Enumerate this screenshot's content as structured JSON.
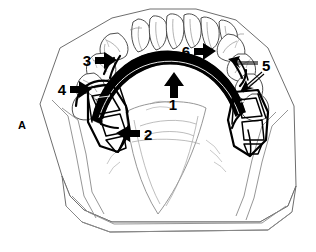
{
  "figure": {
    "panel_label": "A",
    "background_color": "#ffffff",
    "ink_color": "#000000",
    "cast_outline_color": "#6e6e6e",
    "width": 316,
    "height": 252
  },
  "callouts": [
    {
      "id": "callout-1",
      "label": "1",
      "arrow_direction": "up",
      "label_x": 173,
      "label_y": 103,
      "target": "anterior-palatal-strap-major-connector"
    },
    {
      "id": "callout-2",
      "label": "2",
      "arrow_direction": "left",
      "label_x": 144,
      "label_y": 139,
      "target": "left-lattice-retentive-framework"
    },
    {
      "id": "callout-3",
      "label": "3",
      "arrow_direction": "right",
      "label_x": 89,
      "label_y": 65,
      "target": "left-occlusal-rest"
    },
    {
      "id": "callout-4",
      "label": "4",
      "arrow_direction": "right",
      "label_x": 62,
      "label_y": 94,
      "target": "left-retentive-clasp-arm"
    },
    {
      "id": "callout-5",
      "label": "5",
      "arrow_direction": "double-leader-left",
      "label_x": 262,
      "label_y": 69,
      "target": "right-clasp-assembly-and-rest-seat"
    },
    {
      "id": "callout-6",
      "label": "6",
      "arrow_direction": "right",
      "label_x": 186,
      "label_y": 56,
      "target": "right-posterior-major-connector-border"
    }
  ],
  "anatomy": {
    "arch_type": "maxillary",
    "anterior_teeth_count": 6,
    "left_posterior_teeth_count": 4,
    "right_posterior_teeth_count": 4,
    "framework_components": [
      "anterior-palatal-strap",
      "lattice-mesh-retention-left",
      "lattice-mesh-retention-right",
      "occlusal-rests",
      "clasp-arms"
    ]
  }
}
